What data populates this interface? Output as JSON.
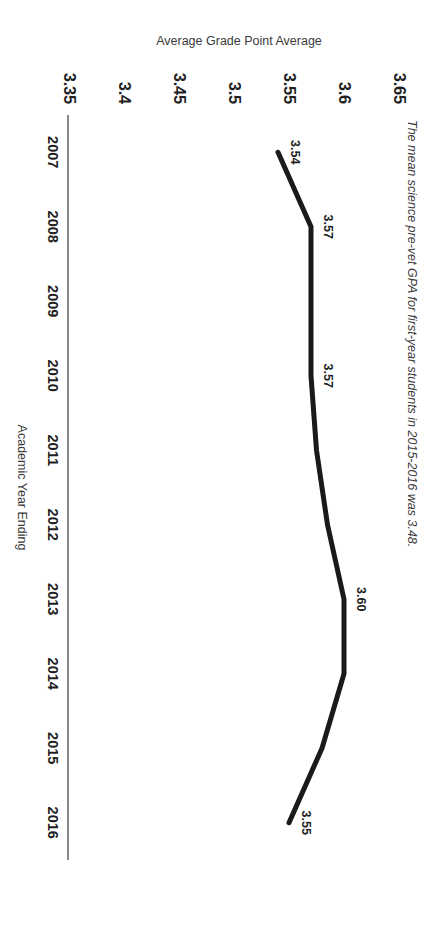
{
  "chart_data": {
    "type": "line",
    "title": "",
    "xlabel": "Academic Year Ending",
    "ylabel": "Average Grade Point Average",
    "categories": [
      "2007",
      "2008",
      "2009",
      "2010",
      "2011",
      "2012",
      "2013",
      "2014",
      "2015",
      "2016"
    ],
    "values": [
      3.54,
      3.57,
      3.57,
      3.57,
      3.575,
      3.585,
      3.6,
      3.6,
      3.58,
      3.55
    ],
    "point_labels": [
      {
        "category": "2007",
        "text": "3.54"
      },
      {
        "category": "2008",
        "text": "3.57"
      },
      {
        "category": "2010",
        "text": "3.57"
      },
      {
        "category": "2013",
        "text": "3.60"
      },
      {
        "category": "2016",
        "text": "3.55"
      }
    ],
    "yticks": [
      "3.35",
      "3.4",
      "3.45",
      "3.5",
      "3.55",
      "3.6",
      "3.65"
    ],
    "ylim": [
      3.35,
      3.65
    ],
    "grid": false,
    "legend": false,
    "annotation": "The mean science pre-vet GPA for first-year students in 2015-2016 was 3.48.",
    "line_color": "#1a1a1a",
    "axis_color": "#8a8a8a",
    "text_color": "#1f1f1f"
  },
  "axes": {
    "y": {
      "title": "Average Grade Point Average",
      "ticks": [
        "3.35",
        "3.4",
        "3.45",
        "3.5",
        "3.55",
        "3.6",
        "3.65"
      ]
    },
    "x": {
      "title": "Academic Year Ending",
      "ticks": [
        "2007",
        "2008",
        "2009",
        "2010",
        "2011",
        "2012",
        "2013",
        "2014",
        "2015",
        "2016"
      ]
    }
  },
  "note": {
    "text": "The mean science pre-vet GPA for first-year students in 2015-2016 was 3.48."
  }
}
